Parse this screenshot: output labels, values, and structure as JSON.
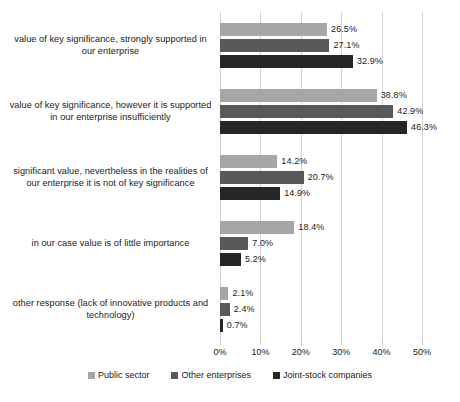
{
  "chart_data": {
    "type": "bar",
    "orientation": "horizontal",
    "title": "",
    "subtitle": "",
    "xlabel": "",
    "ylabel": "",
    "xlim": [
      0,
      50
    ],
    "grid": true,
    "legend_position": "bottom",
    "xticks": [
      "0%",
      "10%",
      "20%",
      "30%",
      "40%",
      "50%"
    ],
    "xtick_values": [
      0,
      10,
      20,
      30,
      40,
      50
    ],
    "categories": [
      "value of key significance, strongly supported in our enterprise",
      "value of key significance, however it is supported in our enterprise insufficiently",
      "significant value, nevertheless in the realities of our enterprise it is not of key significance",
      "in our case value is of little importance",
      "other response (lack of innovative products and technology)"
    ],
    "series": [
      {
        "name": "Public sector",
        "color": "#a6a6a6",
        "values": [
          26.5,
          38.8,
          14.2,
          18.4,
          2.1
        ],
        "labels": [
          "26.5%",
          "38.8%",
          "14.2%",
          "18.4%",
          "2.1%"
        ]
      },
      {
        "name": "Other enterprises",
        "color": "#595959",
        "values": [
          27.1,
          42.9,
          20.7,
          7.0,
          2.4
        ],
        "labels": [
          "27.1%",
          "42.9%",
          "20.7%",
          "7.0%",
          "2.4%"
        ]
      },
      {
        "name": "Joint-stock companies",
        "color": "#262626",
        "values": [
          32.9,
          46.3,
          14.9,
          5.2,
          0.7
        ],
        "labels": [
          "32.9%",
          "46.3%",
          "14.9%",
          "5.2%",
          "0.7%"
        ]
      }
    ]
  },
  "legend": {
    "items": [
      {
        "label": "Public sector",
        "color": "#a6a6a6"
      },
      {
        "label": "Other enterprises",
        "color": "#595959"
      },
      {
        "label": "Joint-stock companies",
        "color": "#262626"
      }
    ]
  }
}
